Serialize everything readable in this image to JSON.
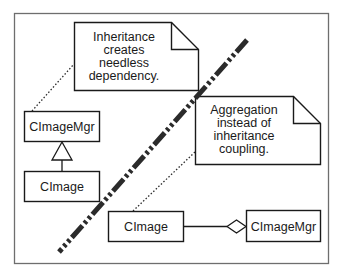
{
  "diagram": {
    "type": "uml-class-comparison",
    "notes": [
      {
        "id": "note-inheritance",
        "lines": [
          "Inheritance",
          "creates",
          "needless",
          "dependency."
        ]
      },
      {
        "id": "note-aggregation",
        "lines": [
          "Aggregation",
          "instead of",
          "inheritance",
          "coupling."
        ]
      }
    ],
    "left_side": {
      "classes": [
        {
          "name": "CImageMgr"
        },
        {
          "name": "CImage"
        }
      ],
      "relationship": "inheritance",
      "relationship_label": "CImage inherits from CImageMgr"
    },
    "right_side": {
      "classes": [
        {
          "name": "CImage"
        },
        {
          "name": "CImageMgr"
        }
      ],
      "relationship": "aggregation",
      "relationship_label": "CImageMgr aggregates CImage"
    },
    "divider": {
      "style": "dash-dot-dot",
      "color": "#2b2b2b"
    }
  }
}
